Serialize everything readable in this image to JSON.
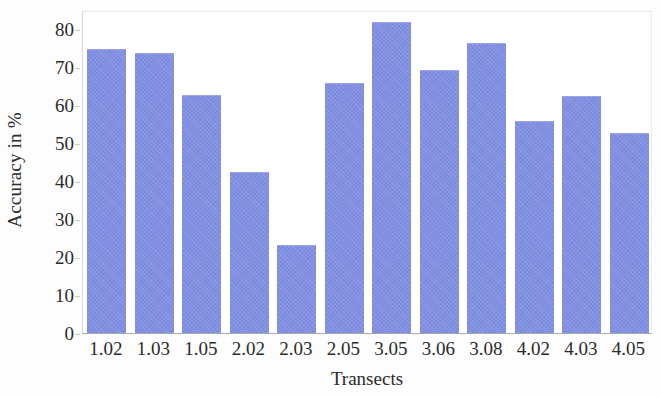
{
  "chart_data": {
    "type": "bar",
    "title": "",
    "xlabel": "Transects",
    "ylabel": "Accuracy in %",
    "categories": [
      "1.02",
      "1.03",
      "1.05",
      "2.02",
      "2.03",
      "2.05",
      "3.05",
      "3.06",
      "3.08",
      "4.02",
      "4.03",
      "4.05"
    ],
    "values": [
      74.5,
      73.5,
      62.5,
      42,
      23,
      65.5,
      81.5,
      69,
      76,
      55.5,
      62,
      52.5
    ],
    "ylim": [
      0,
      85
    ],
    "yticks": [
      0,
      10,
      20,
      30,
      40,
      50,
      60,
      70,
      80
    ],
    "ytick_labels": [
      "0",
      "10",
      "20",
      "30",
      "40",
      "50",
      "60",
      "70",
      "80"
    ],
    "grid": false,
    "legend": null,
    "bar_color": "#808fe2",
    "axis_color": "#2b2b2b"
  }
}
